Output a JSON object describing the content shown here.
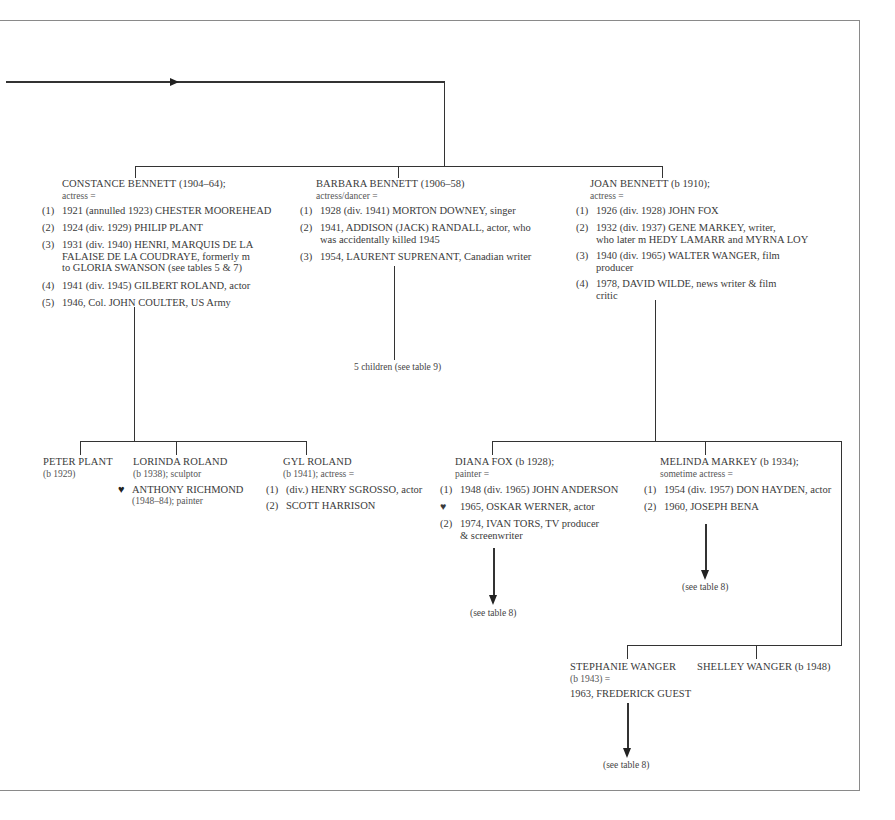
{
  "generation1": [
    {
      "name": "CONSTANCE BENNETT",
      "dates": "(1904–64);",
      "role": "actress =",
      "marriages": [
        {
          "num": "(1)",
          "text": "1921 (annulled 1923) CHESTER MOOREHEAD"
        },
        {
          "num": "(2)",
          "text": "1924 (div. 1929) PHILIP PLANT"
        },
        {
          "num": "(3)",
          "text": "1931 (div. 1940) HENRI, MARQUIS DE LA",
          "cont1": "FALAISE DE LA COUDRAYE, formerly m",
          "cont2": "to GLORIA SWANSON (see tables 5 & 7)"
        },
        {
          "num": "(4)",
          "text": "1941 (div. 1945) GILBERT ROLAND, actor"
        },
        {
          "num": "(5)",
          "text": "1946, Col. JOHN COULTER, US Army"
        }
      ]
    },
    {
      "name": "BARBARA BENNETT",
      "dates": "(1906–58)",
      "role": "actress/dancer =",
      "marriages": [
        {
          "num": "(1)",
          "text": "1928 (div. 1941) MORTON DOWNEY, singer"
        },
        {
          "num": "(2)",
          "text": "1941, ADDISON (JACK) RANDALL, actor, who",
          "cont1": "was accidentally killed 1945"
        },
        {
          "num": "(3)",
          "text": "1954, LAURENT SUPRENANT, Canadian writer"
        }
      ],
      "children_note": "5 children (see table 9)"
    },
    {
      "name": "JOAN BENNETT",
      "dates": "(b 1910);",
      "role": "actress =",
      "marriages": [
        {
          "num": "(1)",
          "text": "1926 (div. 1928) JOHN FOX"
        },
        {
          "num": "(2)",
          "text": "1932 (div. 1937) GENE MARKEY, writer,",
          "cont1": "who later m HEDY LAMARR and MYRNA LOY"
        },
        {
          "num": "(3)",
          "text": "1940 (div. 1965) WALTER WANGER, film",
          "cont1": "producer"
        },
        {
          "num": "(4)",
          "text": "1978, DAVID WILDE, news writer & film",
          "cont1": "critic"
        }
      ]
    }
  ],
  "constance_children": [
    {
      "name": "PETER PLANT",
      "dates": "(b 1929)"
    },
    {
      "name": "LORINDA ROLAND",
      "dates": "(b 1938); sculptor",
      "partner_icon": "heart-icon",
      "partner": "ANTHONY RICHMOND",
      "partner_detail": "(1948–84); painter"
    },
    {
      "name": "GYL ROLAND",
      "dates": "(b 1941); actress =",
      "marriages": [
        {
          "num": "(1)",
          "text": "(div.) HENRY SGROSSO, actor"
        },
        {
          "num": "(2)",
          "text": "SCOTT HARRISON"
        }
      ]
    }
  ],
  "joan_children": [
    {
      "name": "DIANA FOX",
      "dates": "(b 1928);",
      "role": "painter =",
      "marriages": [
        {
          "num": "(1)",
          "text": "1948 (div. 1965) JOHN ANDERSON"
        },
        {
          "num": "♥",
          "text": "1965, OSKAR WERNER, actor"
        },
        {
          "num": "(2)",
          "text": "1974, IVAN TORS, TV producer",
          "cont1": "& screenwriter"
        }
      ],
      "see_note": "(see table 8)"
    },
    {
      "name": "MELINDA MARKEY",
      "dates": "(b 1934);",
      "role": "sometime actress =",
      "marriages": [
        {
          "num": "(1)",
          "text": "1954 (div. 1957) DON HAYDEN, actor"
        },
        {
          "num": "(2)",
          "text": "1960, JOSEPH BENA"
        }
      ],
      "see_note": "(see table 8)"
    },
    {
      "name": "STEPHANIE WANGER",
      "dates": "(b 1943) =",
      "marriage": "1963, FREDERICK GUEST",
      "see_note": "(see table 8)"
    },
    {
      "name": "SHELLEY WANGER",
      "dates": "(b 1948)"
    }
  ],
  "colors": {
    "line": "#333333",
    "frame": "#8a8a8a",
    "text": "#3a3a3a"
  }
}
